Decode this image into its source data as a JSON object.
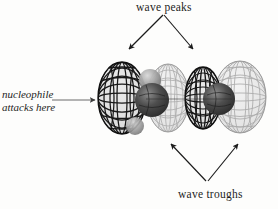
{
  "figure": {
    "type": "molecular-orbital-illustration",
    "background_color": "#fdfdfc",
    "width": 278,
    "height": 209
  },
  "annotations": {
    "top_label": "wave peaks",
    "bottom_label": "wave troughs",
    "left_label_line1": "nucleophile",
    "left_label_line2": "attacks here"
  },
  "arrows": {
    "top": {
      "count": 2,
      "apex": {
        "x": 163,
        "y": 14
      },
      "left_tip": {
        "x": 128,
        "y": 50
      },
      "right_tip": {
        "x": 194,
        "y": 50
      },
      "color": "#1b1b1b"
    },
    "bottom": {
      "count": 2,
      "apex": {
        "x": 207,
        "y": 182
      },
      "left_tip": {
        "x": 170,
        "y": 143
      },
      "right_tip": {
        "x": 239,
        "y": 143
      },
      "color": "#1b1b1b"
    },
    "left": {
      "count": 1,
      "tail": {
        "x": 52,
        "y": 100
      },
      "tip": {
        "x": 96,
        "y": 100
      },
      "color": "#4a4a4a"
    }
  },
  "orbital": {
    "phase_dark_color": "#2b2b2b",
    "phase_light_color": "#b9b9b9",
    "atom_color": "#4a4a4a",
    "atom_dark_color": "#3a3a3a",
    "lobes": [
      {
        "index": 0,
        "phase": "peak",
        "shade": "dark",
        "cx": 122,
        "cy": 98,
        "rx": 24,
        "ry": 36
      },
      {
        "index": 1,
        "phase": "trough",
        "shade": "light",
        "cx": 168,
        "cy": 98,
        "rx": 21,
        "ry": 34
      },
      {
        "index": 2,
        "phase": "peak",
        "shade": "dark",
        "cx": 203,
        "cy": 98,
        "rx": 18,
        "ry": 31
      },
      {
        "index": 3,
        "phase": "trough",
        "shade": "light",
        "cx": 240,
        "cy": 97,
        "rx": 26,
        "ry": 36
      }
    ],
    "atoms": [
      {
        "index": 0,
        "cx": 152,
        "cy": 100,
        "r": 17,
        "shade": "dark"
      },
      {
        "index": 1,
        "cx": 150,
        "cy": 80,
        "r": 11,
        "shade": "light"
      },
      {
        "index": 2,
        "cx": 219,
        "cy": 99,
        "r": 16,
        "shade": "dark"
      },
      {
        "index": 3,
        "cx": 135,
        "cy": 126,
        "r": 9,
        "shade": "light"
      }
    ]
  }
}
